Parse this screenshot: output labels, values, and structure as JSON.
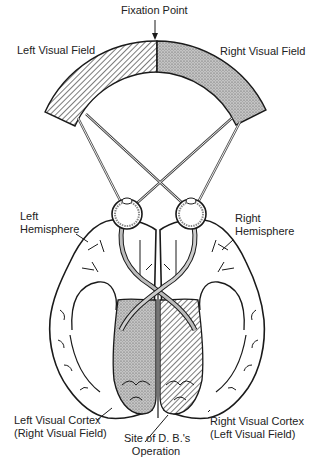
{
  "labels": {
    "fixation_point": "Fixation Point",
    "left_visual_field": "Left Visual Field",
    "right_visual_field": "Right Visual Field",
    "left_hemisphere_1": "Left",
    "left_hemisphere_2": "Hemisphere",
    "right_hemisphere_1": "Right",
    "right_hemisphere_2": "Hemisphere",
    "left_cortex_1": "Left Visual Cortex",
    "left_cortex_2": "(Right Visual Field)",
    "right_cortex_1": "Right Visual Cortex",
    "right_cortex_2": "(Left Visual Field)",
    "site_1": "Site of D. B.'s",
    "site_2": "Operation"
  },
  "colors": {
    "ink": "#1a1a1a",
    "stipple": "#b8b8b8",
    "background": "#ffffff"
  }
}
